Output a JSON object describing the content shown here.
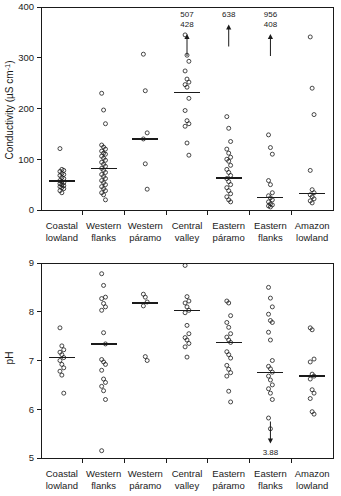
{
  "figure": {
    "title": "",
    "categories": [
      "Coastal lowland",
      "Western flanks",
      "Western páramo",
      "Central valley",
      "Eastern páramo",
      "Eastern flanks",
      "Amazon lowland"
    ],
    "category_lines": [
      [
        "Coastal",
        "lowland"
      ],
      [
        "Western",
        "flanks"
      ],
      [
        "Western",
        "páramo"
      ],
      [
        "Central",
        "valley"
      ],
      [
        "Eastern",
        "páramo"
      ],
      [
        "Eastern",
        "flanks"
      ],
      [
        "Amazon",
        "lowland"
      ]
    ],
    "marker_color": "#1a1a1a",
    "background_color": "#ffffff"
  },
  "chart_data": [
    {
      "type": "scatter",
      "name": "conductivity-panel",
      "title": "",
      "xlabel": "",
      "ylabel": "Conductivity (µS cm⁻¹)",
      "ylabel_parts": {
        "text": "Conductivity (",
        "unit": "µS cm",
        "exponent": "-1",
        "close": ")"
      },
      "ylim": [
        0,
        400
      ],
      "yticks": [
        0,
        100,
        200,
        300,
        400
      ],
      "ytick_labels": [
        "0",
        "100",
        "200",
        "300",
        "400"
      ],
      "grid": false,
      "legend": "none",
      "categories": [
        "Coastal lowland",
        "Western flanks",
        "Western páramo",
        "Central valley",
        "Eastern páramo",
        "Eastern flanks",
        "Amazon lowland"
      ],
      "groups": [
        {
          "category": "Coastal lowland",
          "median": 57,
          "values": [
            121,
            80,
            78,
            76,
            72,
            70,
            68,
            64,
            62,
            58,
            56,
            54,
            52,
            50,
            48,
            46,
            44,
            42,
            38,
            34
          ],
          "offscale_labels": []
        },
        {
          "category": "Western flanks",
          "median": 82,
          "values": [
            230,
            197,
            170,
            128,
            124,
            120,
            116,
            112,
            110,
            106,
            102,
            98,
            94,
            90,
            86,
            82,
            78,
            74,
            70,
            66,
            62,
            58,
            54,
            50,
            46,
            42,
            38,
            34,
            30,
            20
          ],
          "offscale_labels": []
        },
        {
          "category": "Western páramo",
          "median": 140,
          "values": [
            307,
            235,
            152,
            140,
            91,
            41
          ],
          "offscale_labels": []
        },
        {
          "category": "Central valley",
          "median": 232,
          "values": [
            345,
            305,
            293,
            274,
            258,
            252,
            247,
            242,
            220,
            196,
            176,
            170,
            165,
            132,
            108
          ],
          "offscale_labels": [
            "507",
            "428"
          ]
        },
        {
          "category": "Eastern páramo",
          "median": 63,
          "values": [
            184,
            161,
            135,
            120,
            112,
            104,
            100,
            96,
            88,
            80,
            74,
            68,
            62,
            56,
            50,
            44,
            38,
            32,
            26,
            20,
            16
          ],
          "offscale_labels": [
            "638"
          ]
        },
        {
          "category": "Eastern flanks",
          "median": 25,
          "values": [
            148,
            123,
            110,
            58,
            50,
            34,
            28,
            24,
            20,
            16,
            12,
            10,
            8,
            6
          ],
          "offscale_labels": [
            "956",
            "408"
          ]
        },
        {
          "category": "Amazon lowland",
          "median": 33,
          "values": [
            341,
            240,
            188,
            78,
            40,
            34,
            30,
            26,
            22,
            18,
            14
          ],
          "offscale_labels": []
        }
      ]
    },
    {
      "type": "scatter",
      "name": "ph-panel",
      "title": "",
      "xlabel": "",
      "ylabel": "pH",
      "ylim": [
        5,
        9
      ],
      "yticks": [
        5,
        6,
        7,
        8,
        9
      ],
      "ytick_labels": [
        "5",
        "6",
        "7",
        "8",
        "9"
      ],
      "grid": false,
      "legend": "none",
      "categories": [
        "Coastal lowland",
        "Western flanks",
        "Western páramo",
        "Central valley",
        "Eastern páramo",
        "Eastern flanks",
        "Amazon lowland"
      ],
      "groups": [
        {
          "category": "Coastal lowland",
          "median": 7.06,
          "values": [
            7.67,
            7.3,
            7.22,
            7.17,
            7.12,
            7.06,
            7.0,
            6.92,
            6.85,
            6.78,
            6.7,
            6.33
          ],
          "offscale_labels": []
        },
        {
          "category": "Western flanks",
          "median": 7.34,
          "values": [
            8.78,
            8.54,
            8.3,
            8.27,
            8.17,
            8.1,
            8.03,
            7.57,
            7.34,
            7.02,
            6.97,
            6.92,
            6.8,
            6.62,
            6.55,
            6.47,
            6.38,
            6.2,
            5.15
          ],
          "offscale_labels": []
        },
        {
          "category": "Western páramo",
          "median": 8.18,
          "values": [
            8.36,
            8.3,
            8.2,
            8.12,
            7.08,
            7.0
          ],
          "offscale_labels": []
        },
        {
          "category": "Central valley",
          "median": 8.03,
          "values": [
            8.95,
            8.31,
            8.22,
            8.18,
            8.1,
            8.03,
            7.98,
            7.72,
            7.55,
            7.47,
            7.42,
            7.35,
            7.28,
            7.07
          ],
          "offscale_labels": []
        },
        {
          "category": "Eastern páramo",
          "median": 7.37,
          "values": [
            8.22,
            8.18,
            7.92,
            7.78,
            7.68,
            7.55,
            7.48,
            7.42,
            7.37,
            7.18,
            7.12,
            7.05,
            6.9,
            6.82,
            6.75,
            6.68,
            6.37,
            6.15
          ],
          "offscale_labels": []
        },
        {
          "category": "Eastern flanks",
          "median": 6.76,
          "values": [
            8.5,
            8.28,
            8.1,
            7.95,
            7.82,
            7.78,
            7.58,
            7.42,
            7.0,
            6.88,
            6.83,
            6.76,
            6.68,
            6.6,
            6.5,
            6.42,
            6.33,
            6.2,
            5.82,
            5.6
          ],
          "offscale_labels": [
            "3.88"
          ]
        },
        {
          "category": "Amazon lowland",
          "median": 6.68,
          "values": [
            7.67,
            7.63,
            7.03,
            6.97,
            6.72,
            6.68,
            6.62,
            6.4,
            6.33,
            6.22,
            5.95,
            5.9
          ],
          "offscale_labels": []
        }
      ]
    }
  ]
}
